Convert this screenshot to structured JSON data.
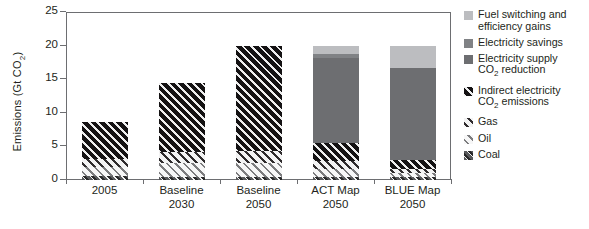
{
  "chart_data": {
    "type": "bar",
    "stacked": true,
    "title": "",
    "xlabel": "",
    "ylabel": "Emissions (Gt CO2)",
    "ylabel_parts": {
      "base": "Emissions (Gt CO",
      "sub": "2",
      "tail": ")"
    },
    "ylim": [
      0,
      25
    ],
    "yticks": [
      0,
      5,
      10,
      15,
      20,
      25
    ],
    "grid": false,
    "legend_position": "right",
    "categories": [
      "2005",
      "Baseline 2030",
      "Baseline 2050",
      "ACT Map 2050",
      "BLUE Map 2050"
    ],
    "category_lines": [
      [
        "2005"
      ],
      [
        "Baseline",
        "2030"
      ],
      [
        "Baseline",
        "2050"
      ],
      [
        "ACT Map",
        "2050"
      ],
      [
        "BLUE Map",
        "2050"
      ]
    ],
    "totals": [
      8.7,
      14.4,
      20.0,
      20.0,
      20.0
    ],
    "series": [
      {
        "name": "Coal",
        "key": "coal",
        "color": "#58595b",
        "pattern": "hatch-dark",
        "values": [
          0.6,
          0.5,
          0.5,
          0.5,
          0.4
        ]
      },
      {
        "name": "Oil",
        "key": "oil",
        "color": "#c7c8ca",
        "pattern": "hatch-light",
        "values": [
          1.3,
          2.0,
          2.1,
          1.2,
          0.7
        ]
      },
      {
        "name": "Gas",
        "key": "gas",
        "color": "#808285",
        "pattern": "hatch-mid",
        "values": [
          1.3,
          1.6,
          1.7,
          1.1,
          0.6
        ]
      },
      {
        "name": "Indirect electricity CO2 emissions",
        "key": "indirect",
        "color": "#1a1718",
        "pattern": "hatch-black",
        "values": [
          5.5,
          10.3,
          15.7,
          2.7,
          1.3
        ]
      },
      {
        "name": "Electricity supply CO2 reduction",
        "key": "supply",
        "color": "#6d6e71",
        "pattern": "solid",
        "values": [
          0,
          0,
          0,
          12.6,
          13.6
        ]
      },
      {
        "name": "Electricity savings",
        "key": "savings",
        "color": "#808285",
        "pattern": "solid",
        "values": [
          0,
          0,
          0,
          0.6,
          0.0
        ]
      },
      {
        "name": "Fuel switching and efficiency gains",
        "key": "fuelsw",
        "color": "#bcbdc0",
        "pattern": "solid",
        "values": [
          0,
          0,
          0,
          1.3,
          3.4
        ]
      }
    ],
    "legend": [
      {
        "label_lines": [
          "Fuel switching and",
          "efficiency gains"
        ],
        "key": "fuelsw"
      },
      {
        "label_lines": [
          "Electricity savings"
        ],
        "key": "savings"
      },
      {
        "label_lines": [
          "Electricity supply",
          "CO2 reduction"
        ],
        "key": "supply",
        "sub_line": 1
      },
      {
        "label_lines": [
          "Indirect electricity",
          "CO2 emissions"
        ],
        "key": "indirect",
        "sub_line": 1
      },
      {
        "label_lines": [
          "Gas"
        ],
        "key": "gas"
      },
      {
        "label_lines": [
          "Oil"
        ],
        "key": "oil"
      },
      {
        "label_lines": [
          "Coal"
        ],
        "key": "coal"
      }
    ]
  },
  "axis": {
    "y_tick_labels": [
      "0",
      "5",
      "10",
      "15",
      "20",
      "25"
    ]
  },
  "legend_text": {
    "fuelsw_l1": "Fuel switching and",
    "fuelsw_l2": "efficiency gains",
    "savings_l1": "Electricity savings",
    "supply_l1": "Electricity supply",
    "supply_l2a": "CO",
    "supply_l2b": "2",
    "supply_l2c": " reduction",
    "indirect_l1": "Indirect electricity",
    "indirect_l2a": "CO",
    "indirect_l2b": "2",
    "indirect_l2c": " emissions",
    "gas": "Gas",
    "oil": "Oil",
    "coal": "Coal"
  },
  "ylabel_text": {
    "a": "Emissions (Gt CO",
    "b": "2",
    "c": ")"
  }
}
